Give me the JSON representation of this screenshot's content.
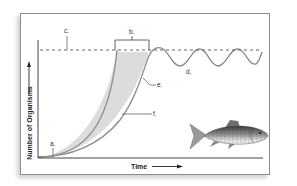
{
  "figure": {
    "y_axis_label": "Number of Organisms",
    "x_axis_label": "Time",
    "labels": {
      "a": "a.",
      "b": "b.",
      "c": "c.",
      "d": "d.",
      "e": "e.",
      "f": "f."
    },
    "illustration": "fish-icon"
  },
  "colors": {
    "frame_border": "#8c8c8c",
    "axis": "#444444",
    "curve": "#8a8a8a",
    "shading": "#dcdcdc",
    "dashed_line": "#555555",
    "text": "#333333"
  }
}
